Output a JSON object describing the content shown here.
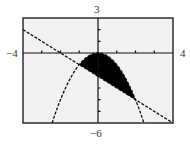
{
  "chart_data": {
    "type": "line",
    "title": "",
    "xlabel": "",
    "ylabel": "",
    "window": {
      "xmin": -4,
      "xmax": 4,
      "ymin": -6,
      "ymax": 3,
      "xscl": 1,
      "yscl": 1
    },
    "xlim": [
      -4,
      4
    ],
    "ylim": [
      -6,
      3
    ],
    "grid": false,
    "window_labels": {
      "top": "3",
      "bottom": "−6",
      "left": "−4",
      "right": "4"
    },
    "series": [
      {
        "name": "y = -x^2",
        "kind": "parabola",
        "style": "dashed",
        "x": [
          -2.45,
          -2,
          -1.5,
          -1,
          -0.5,
          0,
          0.5,
          1,
          1.5,
          2,
          2.45
        ],
        "y": [
          -6,
          -4,
          -2.25,
          -1,
          -0.25,
          0,
          -0.25,
          -1,
          -2.25,
          -4,
          -6
        ]
      },
      {
        "name": "y = -x - 2",
        "kind": "line",
        "style": "dashed",
        "x": [
          -4,
          4
        ],
        "y": [
          2,
          -6
        ]
      }
    ],
    "shaded_region": {
      "description": "Region between y = -x^2 (above) and y = -x - 2 (below)",
      "x_range": [
        -1,
        2
      ],
      "vertices": [
        [
          -1,
          -1
        ],
        [
          2,
          -4
        ]
      ],
      "fill": "#000000"
    }
  },
  "colors": {
    "plot_background": "#f2f2f2",
    "frame": "#222222",
    "ink": "#111111"
  }
}
